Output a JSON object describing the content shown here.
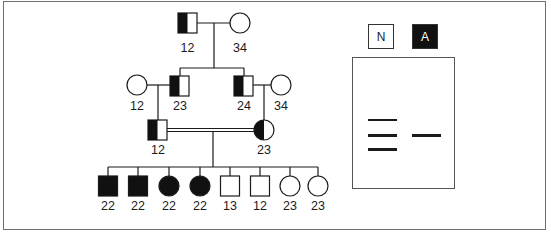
{
  "pedigree": {
    "generation1": [
      {
        "id": "I-1",
        "sex": "male",
        "status": "carrier-left-half",
        "genotype": "12"
      },
      {
        "id": "I-2",
        "sex": "female",
        "status": "unaffected",
        "genotype": "34"
      }
    ],
    "generation2": [
      {
        "id": "II-1",
        "sex": "female",
        "status": "unaffected",
        "genotype": "12"
      },
      {
        "id": "II-2",
        "sex": "male",
        "status": "carrier-left-half",
        "genotype": "23"
      },
      {
        "id": "II-3",
        "sex": "male",
        "status": "carrier-left-half",
        "genotype": "24"
      },
      {
        "id": "II-4",
        "sex": "female",
        "status": "unaffected",
        "genotype": "34"
      }
    ],
    "generation3": [
      {
        "id": "III-1",
        "sex": "male",
        "status": "carrier-left-half",
        "genotype": "12"
      },
      {
        "id": "III-2",
        "sex": "female",
        "status": "carrier-left-half",
        "genotype": "23"
      }
    ],
    "consanguineous_marriage": "III-1 x III-2 (double line)",
    "generation4": [
      {
        "id": "IV-1",
        "sex": "male",
        "status": "affected",
        "genotype": "22"
      },
      {
        "id": "IV-2",
        "sex": "male",
        "status": "affected",
        "genotype": "22"
      },
      {
        "id": "IV-3",
        "sex": "female",
        "status": "affected",
        "genotype": "22"
      },
      {
        "id": "IV-4",
        "sex": "female",
        "status": "affected",
        "genotype": "22"
      },
      {
        "id": "IV-5",
        "sex": "male",
        "status": "unaffected",
        "genotype": "13"
      },
      {
        "id": "IV-6",
        "sex": "male",
        "status": "unaffected",
        "genotype": "12"
      },
      {
        "id": "IV-7",
        "sex": "female",
        "status": "unaffected",
        "genotype": "23"
      },
      {
        "id": "IV-8",
        "sex": "female",
        "status": "unaffected",
        "genotype": "23"
      }
    ]
  },
  "gel": {
    "lanes": [
      {
        "label": "N",
        "style": "white-box",
        "bands": 3
      },
      {
        "label": "A",
        "style": "black-box",
        "bands": 1
      }
    ]
  },
  "colors": {
    "line": "#1a1a1a",
    "fill_affected": "#111111",
    "frame": "#6e6e6e"
  }
}
